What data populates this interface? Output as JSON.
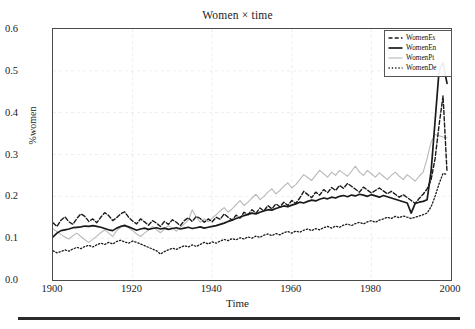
{
  "chart_data": {
    "type": "line",
    "title": "Women × time",
    "xlabel": "Time",
    "ylabel": "%women",
    "xlim": [
      1900,
      2000
    ],
    "ylim": [
      0.0,
      0.6
    ],
    "xticks": [
      1900,
      1920,
      1940,
      1960,
      1980,
      2000
    ],
    "xtick_labels": [
      "1900",
      "1920",
      "1940",
      "1960",
      "1980",
      "2000"
    ],
    "yticks": [
      0.0,
      0.1,
      0.2,
      0.3,
      0.4,
      0.5,
      0.6
    ],
    "ytick_labels": [
      "0.0",
      "0.1",
      "0.2",
      "0.3",
      "0.4",
      "0.5",
      "0.6"
    ],
    "grid": true,
    "grid_color": "#e9e9e9",
    "legend_position": "top-right",
    "x": [
      1900,
      1901,
      1902,
      1903,
      1904,
      1905,
      1906,
      1907,
      1908,
      1909,
      1910,
      1911,
      1912,
      1913,
      1914,
      1915,
      1916,
      1917,
      1918,
      1919,
      1920,
      1921,
      1922,
      1923,
      1924,
      1925,
      1926,
      1927,
      1928,
      1929,
      1930,
      1931,
      1932,
      1933,
      1934,
      1935,
      1936,
      1937,
      1938,
      1939,
      1940,
      1941,
      1942,
      1943,
      1944,
      1945,
      1946,
      1947,
      1948,
      1949,
      1950,
      1951,
      1952,
      1953,
      1954,
      1955,
      1956,
      1957,
      1958,
      1959,
      1960,
      1961,
      1962,
      1963,
      1964,
      1965,
      1966,
      1967,
      1968,
      1969,
      1970,
      1971,
      1972,
      1973,
      1974,
      1975,
      1976,
      1977,
      1978,
      1979,
      1980,
      1981,
      1982,
      1983,
      1984,
      1985,
      1986,
      1987,
      1988,
      1989,
      1990,
      1991,
      1992,
      1993,
      1994,
      1995,
      1996,
      1997,
      1998,
      1999
    ],
    "series": [
      {
        "name": "WomenEs",
        "style": "dashed",
        "color": "#1a1a1a",
        "width": 1.4,
        "values": [
          0.137,
          0.128,
          0.143,
          0.151,
          0.139,
          0.133,
          0.147,
          0.158,
          0.152,
          0.14,
          0.146,
          0.137,
          0.15,
          0.161,
          0.154,
          0.142,
          0.149,
          0.158,
          0.163,
          0.15,
          0.141,
          0.134,
          0.146,
          0.139,
          0.131,
          0.142,
          0.136,
          0.128,
          0.14,
          0.133,
          0.144,
          0.138,
          0.13,
          0.142,
          0.149,
          0.14,
          0.152,
          0.147,
          0.138,
          0.146,
          0.139,
          0.15,
          0.145,
          0.158,
          0.15,
          0.143,
          0.155,
          0.148,
          0.162,
          0.156,
          0.168,
          0.16,
          0.172,
          0.165,
          0.178,
          0.17,
          0.182,
          0.175,
          0.186,
          0.178,
          0.19,
          0.183,
          0.196,
          0.212,
          0.204,
          0.197,
          0.21,
          0.203,
          0.216,
          0.209,
          0.221,
          0.214,
          0.226,
          0.219,
          0.231,
          0.224,
          0.217,
          0.21,
          0.222,
          0.215,
          0.208,
          0.214,
          0.22,
          0.213,
          0.206,
          0.212,
          0.205,
          0.198,
          0.204,
          0.197,
          0.19,
          0.183,
          0.195,
          0.205,
          0.218,
          0.24,
          0.29,
          0.37,
          0.44,
          0.258
        ]
      },
      {
        "name": "WomenEn",
        "style": "solid",
        "color": "#1a1a1a",
        "width": 1.7,
        "values": [
          0.103,
          0.112,
          0.118,
          0.12,
          0.122,
          0.125,
          0.126,
          0.127,
          0.129,
          0.128,
          0.13,
          0.128,
          0.126,
          0.123,
          0.12,
          0.118,
          0.124,
          0.128,
          0.13,
          0.127,
          0.123,
          0.119,
          0.122,
          0.124,
          0.121,
          0.123,
          0.125,
          0.122,
          0.124,
          0.121,
          0.123,
          0.125,
          0.122,
          0.124,
          0.126,
          0.123,
          0.125,
          0.127,
          0.124,
          0.126,
          0.128,
          0.13,
          0.133,
          0.136,
          0.14,
          0.143,
          0.147,
          0.15,
          0.154,
          0.157,
          0.16,
          0.158,
          0.162,
          0.165,
          0.168,
          0.167,
          0.171,
          0.174,
          0.177,
          0.175,
          0.179,
          0.182,
          0.186,
          0.184,
          0.188,
          0.191,
          0.189,
          0.193,
          0.196,
          0.194,
          0.198,
          0.196,
          0.2,
          0.202,
          0.199,
          0.203,
          0.201,
          0.205,
          0.203,
          0.2,
          0.204,
          0.201,
          0.198,
          0.202,
          0.199,
          0.196,
          0.193,
          0.19,
          0.187,
          0.184,
          0.16,
          0.183,
          0.186,
          0.188,
          0.192,
          0.26,
          0.38,
          0.5,
          0.52,
          0.47
        ]
      },
      {
        "name": "WomenPt",
        "style": "thin-solid",
        "color": "#b8b8b8",
        "width": 1.1,
        "values": [
          0.122,
          0.116,
          0.109,
          0.103,
          0.098,
          0.106,
          0.112,
          0.104,
          0.096,
          0.09,
          0.097,
          0.105,
          0.113,
          0.12,
          0.112,
          0.104,
          0.118,
          0.126,
          0.133,
          0.125,
          0.118,
          0.11,
          0.104,
          0.112,
          0.12,
          0.128,
          0.12,
          0.113,
          0.122,
          0.13,
          0.124,
          0.117,
          0.126,
          0.134,
          0.143,
          0.168,
          0.15,
          0.138,
          0.146,
          0.139,
          0.148,
          0.156,
          0.165,
          0.173,
          0.162,
          0.17,
          0.18,
          0.19,
          0.178,
          0.186,
          0.196,
          0.205,
          0.192,
          0.2,
          0.21,
          0.218,
          0.206,
          0.214,
          0.224,
          0.232,
          0.22,
          0.228,
          0.24,
          0.252,
          0.245,
          0.238,
          0.25,
          0.262,
          0.254,
          0.246,
          0.258,
          0.25,
          0.262,
          0.255,
          0.248,
          0.26,
          0.272,
          0.258,
          0.25,
          0.262,
          0.254,
          0.246,
          0.256,
          0.248,
          0.24,
          0.25,
          0.258,
          0.248,
          0.24,
          0.252,
          0.244,
          0.236,
          0.248,
          0.258,
          0.29,
          0.33,
          0.348,
          0.345,
          0.342,
          0.34
        ]
      },
      {
        "name": "WomenDe",
        "style": "dotted",
        "color": "#1a1a1a",
        "width": 1.3,
        "values": [
          0.07,
          0.065,
          0.068,
          0.072,
          0.069,
          0.074,
          0.078,
          0.075,
          0.08,
          0.083,
          0.079,
          0.084,
          0.088,
          0.085,
          0.09,
          0.086,
          0.092,
          0.095,
          0.091,
          0.088,
          0.093,
          0.09,
          0.086,
          0.082,
          0.078,
          0.074,
          0.07,
          0.062,
          0.068,
          0.072,
          0.076,
          0.073,
          0.078,
          0.082,
          0.079,
          0.084,
          0.08,
          0.085,
          0.09,
          0.086,
          0.091,
          0.088,
          0.093,
          0.097,
          0.094,
          0.099,
          0.096,
          0.101,
          0.098,
          0.103,
          0.1,
          0.105,
          0.102,
          0.107,
          0.11,
          0.106,
          0.111,
          0.108,
          0.113,
          0.116,
          0.112,
          0.117,
          0.114,
          0.119,
          0.122,
          0.118,
          0.123,
          0.12,
          0.125,
          0.128,
          0.124,
          0.129,
          0.126,
          0.131,
          0.134,
          0.13,
          0.135,
          0.138,
          0.134,
          0.139,
          0.142,
          0.138,
          0.143,
          0.146,
          0.15,
          0.147,
          0.152,
          0.149,
          0.153,
          0.15,
          0.147,
          0.15,
          0.153,
          0.156,
          0.16,
          0.175,
          0.2,
          0.23,
          0.255,
          0.252
        ]
      }
    ]
  },
  "legend": {
    "items": [
      {
        "label": "WomenEs"
      },
      {
        "label": "WomenEn"
      },
      {
        "label": "WomenPt"
      },
      {
        "label": "WomenDe"
      }
    ]
  }
}
